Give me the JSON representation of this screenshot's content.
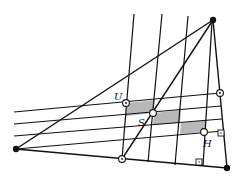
{
  "diagram": {
    "type": "geometry-construction",
    "width": 243,
    "height": 181,
    "colors": {
      "stroke": "#111111",
      "shade": "#b8b8b8",
      "background": "#ffffff"
    },
    "vertices": [
      {
        "id": "left",
        "x": 16,
        "y": 149,
        "style": "filled"
      },
      {
        "id": "top",
        "x": 213,
        "y": 20,
        "style": "filled"
      },
      {
        "id": "bottom-right",
        "x": 227,
        "y": 168,
        "style": "filled"
      }
    ],
    "points": [
      {
        "id": "U",
        "label": "U",
        "x": 126,
        "y": 103,
        "style": "dotted-circle",
        "label_x": 114,
        "label_y": 100
      },
      {
        "id": "S",
        "label": "S",
        "x": 153,
        "y": 113,
        "style": "open-circle",
        "label_x": 138,
        "label_y": 126
      },
      {
        "id": "H",
        "label": "H",
        "x": 204,
        "y": 132,
        "style": "open-circle",
        "label_x": 203,
        "label_y": 147
      },
      {
        "id": "right",
        "label": "",
        "x": 220,
        "y": 93,
        "style": "dotted-circle"
      },
      {
        "id": "bottom",
        "label": "",
        "x": 122,
        "y": 159,
        "style": "dotted-circle"
      }
    ],
    "triangle_edges": [
      {
        "from": "left",
        "to": "top"
      },
      {
        "from": "left",
        "to": "bottom-right"
      },
      {
        "from": "top",
        "to": "bottom-right"
      }
    ],
    "cevians": [
      {
        "x1": 213,
        "y1": 20,
        "x2": 122,
        "y2": 159
      }
    ],
    "horizontal_lines": [
      {
        "x1": 14,
        "y1": 112,
        "x2": 220,
        "y2": 93
      },
      {
        "x1": 14,
        "y1": 124,
        "x2": 221,
        "y2": 106
      },
      {
        "x1": 14,
        "y1": 136,
        "x2": 222,
        "y2": 119
      },
      {
        "x1": 16,
        "y1": 149,
        "x2": 223,
        "y2": 131
      }
    ],
    "vertical_lines": [
      {
        "x1": 134,
        "y1": 14,
        "x2": 122,
        "y2": 159
      },
      {
        "x1": 162,
        "y1": 14,
        "x2": 148,
        "y2": 162
      },
      {
        "x1": 188,
        "y1": 16,
        "x2": 175,
        "y2": 165
      },
      {
        "x1": 212,
        "y1": 22,
        "x2": 203,
        "y2": 166
      }
    ],
    "shaded_regions": [
      {
        "points": "127,103 155,100 153,113 126,116"
      },
      {
        "points": "154,113 181,110 180,123 153,125"
      },
      {
        "points": "181,123 206,120 204,132 180,134"
      }
    ],
    "right_angle_markers": [
      {
        "x": 218,
        "y": 130,
        "size": 6
      },
      {
        "x": 196,
        "y": 159,
        "size": 6
      }
    ]
  }
}
